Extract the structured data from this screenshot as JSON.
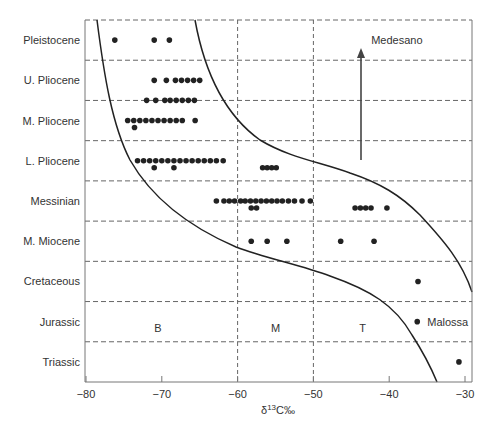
{
  "chart_data": {
    "type": "scatter",
    "title": "",
    "xlabel": "δ13C‰",
    "xlabel_parts": {
      "delta": "δ",
      "sup": "13",
      "rest": "C‰"
    },
    "ylabel": "",
    "xlim": [
      -80,
      -30
    ],
    "x_ticks": [
      -80,
      -70,
      -60,
      -50,
      -40,
      -30
    ],
    "x_tick_labels": [
      "−80",
      "−70",
      "−60",
      "−50",
      "−40",
      "−30"
    ],
    "y_categories": [
      "Pleistocene",
      "U. Pliocene",
      "M. Pliocene",
      "L. Pliocene",
      "Messinian",
      "M. Miocene",
      "Cretaceous",
      "Jurassic",
      "Triassic"
    ],
    "grid": {
      "horizontal_dashed": true,
      "vertical_dashed_at": [
        -60,
        -50
      ]
    },
    "regions": [
      {
        "label": "B",
        "x": -70.5,
        "row": "Jurassic"
      },
      {
        "label": "M",
        "x": -55,
        "row": "Jurassic"
      },
      {
        "label": "T",
        "x": -43.5,
        "row": "Jurassic"
      }
    ],
    "annotations": [
      {
        "label": "Medesano",
        "x": -43.7,
        "row": "Pleistocene"
      },
      {
        "label": "Malossa",
        "x": -36.3,
        "row": "Jurassic"
      }
    ],
    "arrow": {
      "x": -43.7,
      "from_row_offset": "L. Pliocene",
      "to_row": "Pleistocene",
      "note": "arrow pointing up to Medesano"
    },
    "series": [
      {
        "row": "Pleistocene",
        "values": [
          -76.2,
          -71.0,
          -69.0
        ]
      },
      {
        "row": "U. Pliocene",
        "values": [
          -71.0,
          -69.4,
          -68.2,
          -67.4,
          -66.6,
          -65.8,
          -65.0,
          -72.0,
          -70.8,
          -69.6,
          -68.9,
          -68.1,
          -67.3,
          -66.5,
          -65.7
        ]
      },
      {
        "row": "M. Pliocene",
        "values": [
          -74.5,
          -73.7,
          -72.9,
          -72.1,
          -71.3,
          -70.5,
          -69.7,
          -68.9,
          -68.1,
          -67.3,
          -65.6,
          -73.6
        ]
      },
      {
        "row": "L. Pliocene",
        "values": [
          -73.2,
          -72.4,
          -71.6,
          -70.8,
          -70.0,
          -69.2,
          -68.4,
          -67.6,
          -66.8,
          -66.0,
          -65.2,
          -64.4,
          -63.6,
          -62.8,
          -61.9,
          -71.0,
          -68.4,
          -56.7,
          -56.1,
          -55.5,
          -54.9
        ]
      },
      {
        "row": "Messinian",
        "values": [
          -62.8,
          -61.8,
          -61.1,
          -60.4,
          -59.6,
          -59.0,
          -58.3,
          -57.6,
          -56.9,
          -56.2,
          -55.5,
          -54.8,
          -54.1,
          -53.3,
          -52.5,
          -51.5,
          -50.4,
          -58.2,
          -57.5,
          -44.5,
          -43.8,
          -43.1,
          -42.4,
          -40.3
        ]
      },
      {
        "row": "M. Miocene",
        "values": [
          -58.2,
          -56.1,
          -53.5,
          -46.4,
          -42.0
        ]
      },
      {
        "row": "Cretaceous",
        "values": [
          -36.2
        ]
      },
      {
        "row": "Jurassic",
        "values": [
          -36.3
        ]
      },
      {
        "row": "Triassic",
        "values": [
          -30.8
        ]
      }
    ],
    "curves": [
      {
        "name": "B/M boundary",
        "description": "steep curve from top near −79 descending to ~−60 at M. Miocene/Cretaceous border then flattening to −50 and curving down to ~−34 at bottom"
      },
      {
        "name": "M/T boundary",
        "description": "curve from top near −66 descending to ~−50 at L. Pliocene and curving down to −30 at Jurassic"
      }
    ]
  }
}
